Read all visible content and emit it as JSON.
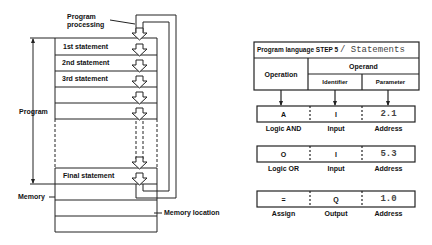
{
  "left_diagram": {
    "processing_label_1": "Program",
    "processing_label_2": "processing",
    "statements": [
      "1st statement",
      "2nd statement",
      "3rd statement"
    ],
    "final_statement": "Final statement",
    "program_label": "Program",
    "memory_label": "Memory",
    "memory_location_label": "Memory location"
  },
  "right_diagram": {
    "title_prefix": "Program language STEP 5",
    "title_suffix": "/ Statements",
    "header": {
      "operation": "Operation",
      "operand": "Operand",
      "identifier": "Identifier",
      "parameter": "Parameter"
    },
    "rows": [
      {
        "operation": "A",
        "identifier": "I",
        "parameter": "2.1",
        "operation_desc": "Logic AND",
        "identifier_desc": "Input",
        "parameter_desc": "Address"
      },
      {
        "operation": "O",
        "identifier": "I",
        "parameter": "5.3",
        "operation_desc": "Logic OR",
        "identifier_desc": "Input",
        "parameter_desc": "Address"
      },
      {
        "operation": "=",
        "identifier": "Q",
        "parameter": "1.0",
        "operation_desc": "Assign",
        "identifier_desc": "Output",
        "parameter_desc": "Address"
      }
    ]
  }
}
